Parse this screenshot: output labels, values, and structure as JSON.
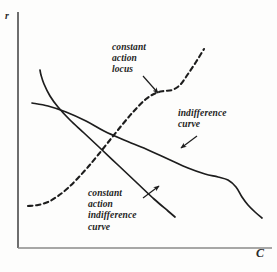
{
  "figure": {
    "title": "",
    "background_color": "#fdfdfc",
    "ink_color": "#1d1d1d"
  },
  "axes": {
    "ylabel": "r",
    "xlabel": "C",
    "origin": [
      18,
      248
    ],
    "x_axis_end": [
      272,
      248
    ],
    "y_axis_top": [
      18,
      12
    ]
  },
  "annotations": [
    {
      "name": "constant-action-locus",
      "text": "constant\naction\nlocus",
      "position": [
        112,
        42
      ],
      "arrow_from": [
        143,
        76
      ],
      "arrow_to": [
        158,
        93
      ]
    },
    {
      "name": "indifference-curve",
      "text": "indifference\ncurve",
      "position": [
        178,
        108
      ],
      "arrow_from": [
        197,
        136
      ],
      "arrow_to": [
        181,
        148
      ]
    },
    {
      "name": "constant-action-indifference-curve",
      "text": "constant\naction\nindifference\ncurve",
      "position": [
        88,
        188
      ],
      "arrow_from": [
        143,
        198
      ],
      "arrow_to": [
        159,
        186
      ]
    }
  ],
  "chart_data": {
    "type": "line",
    "title": "",
    "xlabel": "C",
    "ylabel": "r",
    "xlim": [
      0,
      277
    ],
    "ylim": [
      0,
      272
    ],
    "grid": false,
    "legend": "none",
    "axis_note": "Unlabeled qualitative economics diagram; coordinates are pixel positions in the source figure.",
    "series": [
      {
        "name": "indifference curve",
        "style": "solid",
        "label_text": "indifference curve",
        "points": [
          [
            32,
            103
          ],
          [
            48,
            106
          ],
          [
            66,
            112
          ],
          [
            86,
            121
          ],
          [
            104,
            131
          ],
          [
            124,
            140
          ],
          [
            146,
            149
          ],
          [
            168,
            159
          ],
          [
            188,
            168
          ],
          [
            205,
            174
          ],
          [
            218,
            177
          ],
          [
            228,
            180
          ],
          [
            236,
            187
          ],
          [
            242,
            197
          ],
          [
            248,
            205
          ],
          [
            255,
            212
          ],
          [
            262,
            218
          ]
        ]
      },
      {
        "name": "constant action indifference curve",
        "style": "solid",
        "label_text": "constant action indifference curve",
        "points": [
          [
            40,
            70
          ],
          [
            41,
            75
          ],
          [
            44,
            84
          ],
          [
            50,
            96
          ],
          [
            58,
            107
          ],
          [
            70,
            120
          ],
          [
            84,
            133
          ],
          [
            100,
            148
          ],
          [
            118,
            165
          ],
          [
            136,
            182
          ],
          [
            154,
            199
          ],
          [
            168,
            211
          ],
          [
            175,
            217
          ]
        ]
      },
      {
        "name": "constant action locus",
        "style": "dashed",
        "label_text": "constant action locus",
        "points": [
          [
            28,
            206
          ],
          [
            38,
            205
          ],
          [
            48,
            202
          ],
          [
            58,
            196
          ],
          [
            68,
            188
          ],
          [
            78,
            178
          ],
          [
            88,
            167
          ],
          [
            98,
            155
          ],
          [
            110,
            140
          ],
          [
            122,
            125
          ],
          [
            134,
            111
          ],
          [
            146,
            99
          ],
          [
            156,
            93
          ],
          [
            164,
            91
          ],
          [
            172,
            90
          ],
          [
            180,
            85
          ],
          [
            188,
            74
          ],
          [
            196,
            62
          ],
          [
            204,
            49
          ]
        ]
      }
    ]
  }
}
